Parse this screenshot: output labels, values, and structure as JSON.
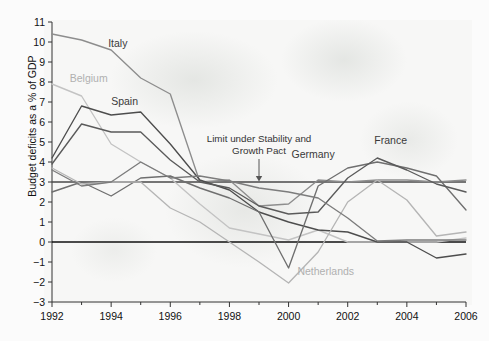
{
  "chart_data": {
    "type": "line",
    "title": "",
    "xlabel": "",
    "ylabel": "Budget deficits as a % of GDP",
    "xlim": [
      1992,
      2006
    ],
    "ylim": [
      -3,
      11
    ],
    "x": [
      1992,
      1993,
      1994,
      1995,
      1996,
      1997,
      1998,
      1999,
      2000,
      2001,
      2002,
      2003,
      2004,
      2005,
      2006
    ],
    "xticks": [
      "1992",
      "1994",
      "1996",
      "1998",
      "2000",
      "2002",
      "2004",
      "2006"
    ],
    "yticks": [
      "11",
      "10",
      "9",
      "8",
      "7",
      "6",
      "5",
      "4",
      "3",
      "2",
      "1",
      "0",
      "-1",
      "-2",
      "-3"
    ],
    "grid": false,
    "legend": "inline-labels",
    "reference_lines": [
      {
        "name": "stability-and-growth-pact-limit",
        "value": 3,
        "color": "#4a4a4a"
      },
      {
        "name": "zero-line",
        "value": 0,
        "color": "#111111"
      }
    ],
    "annotations": [
      {
        "name": "limit-annotation",
        "line1": "Limit under Stability and",
        "line2": "Growth Pact",
        "points_to_year": 1999,
        "points_to_value": 3
      }
    ],
    "series": [
      {
        "name": "Italy",
        "color": "#8d8d8d",
        "label_x": 1993.9,
        "label_y": 9.75,
        "values": [
          10.4,
          10.1,
          9.6,
          8.2,
          7.4,
          3.0,
          3.1,
          1.8,
          1.9,
          3.1,
          3.0,
          3.1,
          3.1,
          3.0,
          3.1
        ]
      },
      {
        "name": "Belgium",
        "color": "#c3c3c3",
        "label_x": 1992.6,
        "label_y": 8.0,
        "values": [
          7.9,
          7.3,
          4.9,
          4.0,
          3.2,
          1.9,
          0.7,
          0.4,
          0.1,
          0.6,
          0.0,
          0.0,
          0.0,
          0.0,
          0.2
        ]
      },
      {
        "name": "Spain",
        "color": "#4d4d4d",
        "label_x": 1994.0,
        "label_y": 6.85,
        "values": [
          4.2,
          6.8,
          6.35,
          6.5,
          4.9,
          3.1,
          2.6,
          1.5,
          1.0,
          0.6,
          0.5,
          0.0,
          0.0,
          -0.8,
          -0.6
        ]
      },
      {
        "name": "Germany",
        "color": "#6f6f6f",
        "label_x": 2000.1,
        "label_y": 4.2,
        "values": [
          2.5,
          3.0,
          2.3,
          3.2,
          3.3,
          2.7,
          2.2,
          1.5,
          -1.3,
          2.8,
          3.7,
          4.0,
          3.7,
          3.3,
          1.6
        ]
      },
      {
        "name": "France",
        "color": "#5a5a5a",
        "label_x": 2002.9,
        "label_y": 4.9,
        "values": [
          3.9,
          5.9,
          5.5,
          5.5,
          4.1,
          3.0,
          2.7,
          1.8,
          1.4,
          1.5,
          3.2,
          4.2,
          3.6,
          2.9,
          2.5
        ]
      },
      {
        "name": "Netherlands",
        "color": "#b5b5b5",
        "label_x": 2000.3,
        "label_y": -1.65,
        "values": [
          3.7,
          2.9,
          3.0,
          3.0,
          1.7,
          1.0,
          0.0,
          -1.0,
          -2.05,
          -0.5,
          2.0,
          3.1,
          2.1,
          0.3,
          0.5
        ]
      },
      {
        "name": "series-7",
        "color": "#7c7c7c",
        "label_x": null,
        "label_y": null,
        "values": [
          3.6,
          2.8,
          3.0,
          4.0,
          3.2,
          3.3,
          3.05,
          2.7,
          2.5,
          2.2,
          1.2,
          0.05,
          0.1,
          0.1,
          0.1
        ]
      }
    ]
  },
  "axis": {
    "y_axis_title": "Budget deficits as a % of GDP"
  }
}
